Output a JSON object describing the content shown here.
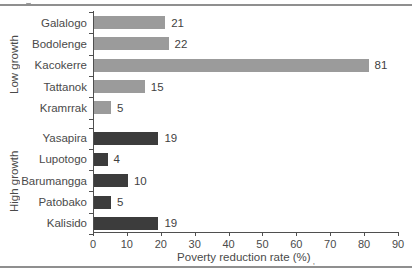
{
  "chart_data": {
    "type": "bar",
    "orientation": "horizontal",
    "title": "",
    "xlabel": "Poverty reduction rate (%)",
    "xlabel_footnote_mark": ",",
    "ylabel": "",
    "xlim": [
      0,
      90
    ],
    "x_ticks": [
      0,
      10,
      20,
      30,
      40,
      50,
      60,
      70,
      80,
      90
    ],
    "grid": false,
    "value_labels": true,
    "groups": [
      {
        "label": "Low growth",
        "bar_color": "#9b9b9b",
        "items": [
          {
            "name": "Galalogo",
            "value": 21
          },
          {
            "name": "Bodolenge",
            "value": 22
          },
          {
            "name": "Kacokerre",
            "value": 81
          },
          {
            "name": "Tattanok",
            "value": 15
          },
          {
            "name": "Kramrrak",
            "value": 5
          }
        ]
      },
      {
        "label": "High growth",
        "bar_color": "#3c3c3c",
        "items": [
          {
            "name": "Yasapira",
            "value": 19
          },
          {
            "name": "Lupotogo",
            "value": 4
          },
          {
            "name": "Barumangga",
            "value": 10
          },
          {
            "name": "Patobako",
            "value": 5
          },
          {
            "name": "Kalisido",
            "value": 19
          }
        ]
      }
    ],
    "colors": {
      "axis": "#4f4f4f",
      "text": "#4a4a4a",
      "rule": "#8f8f8f",
      "background": "#ffffff"
    }
  }
}
